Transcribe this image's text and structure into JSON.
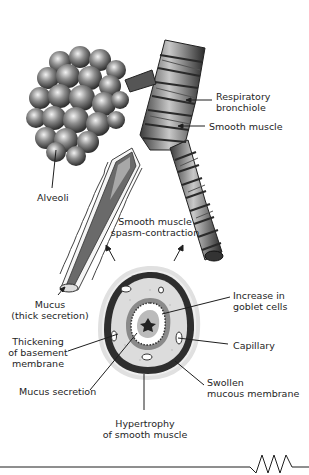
{
  "figure": {
    "labels": {
      "respiratory_bronchiole": [
        "Respiratory",
        "bronchiole"
      ],
      "smooth_muscle": "Smooth muscle",
      "alveoli": "Alveoli",
      "spasm": [
        "Smooth muscle",
        "spasm-contraction"
      ],
      "mucus_thick": [
        "Mucus",
        "(thick secretion)"
      ],
      "goblet": [
        "Increase in",
        "goblet cells"
      ],
      "thickening": [
        "Thickening",
        "of basement",
        "membrane"
      ],
      "capillary": "Capillary",
      "mucus_secretion": "Mucus secretion",
      "swollen": [
        "Swollen",
        "mucous membrane"
      ],
      "hypertrophy": [
        "Hypertrophy",
        "of smooth muscle"
      ]
    },
    "colors": {
      "ink": "#1e1e1e",
      "tissue_dark": "#3a3a3a",
      "tissue_mid": "#8a8a8a",
      "tissue_light": "#d9d9d9"
    }
  }
}
